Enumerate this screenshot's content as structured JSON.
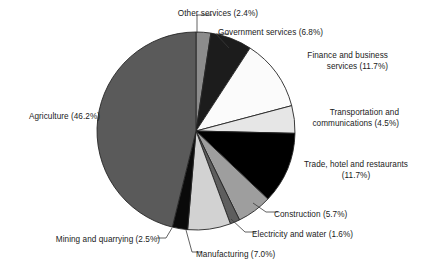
{
  "chart_data": {
    "type": "pie",
    "title": "",
    "subtitle": "",
    "xlabel": "",
    "ylabel": "",
    "legend_position": "none",
    "grid": false,
    "units": "percent",
    "total": 100.0,
    "categories": [
      "Other services",
      "Government services",
      "Finance and business services",
      "Transportation and communications",
      "Trade, hotel and restaurants",
      "Construction",
      "Electricity and water",
      "Manufacturing",
      "Mining and quarrying",
      "Agriculture"
    ],
    "values": [
      2.4,
      6.8,
      11.7,
      4.5,
      11.7,
      5.7,
      1.6,
      7.0,
      2.5,
      46.2
    ],
    "slices": [
      {
        "name": "Other services",
        "value": 2.4,
        "label": "Other services (2.4%)",
        "color": "#8c8c8c"
      },
      {
        "name": "Government services",
        "value": 6.8,
        "label": "Government services (6.8%)",
        "color": "#1c1c1c"
      },
      {
        "name": "Finance and business services",
        "value": 11.7,
        "label_line1": "Finance and business",
        "label_line2": "services (11.7%)",
        "color": "#fbfbfb"
      },
      {
        "name": "Transportation and communications",
        "value": 4.5,
        "label_line1": "Transportation and",
        "label_line2": "communications (4.5%)",
        "color": "#e6e6e6"
      },
      {
        "name": "Trade, hotel and restaurants",
        "value": 11.7,
        "label_line1": "Trade, hotel and restaurants",
        "label_line2": "(11.7%)",
        "color": "#000000"
      },
      {
        "name": "Construction",
        "value": 5.7,
        "label": "Construction (5.7%)",
        "color": "#9e9e9e"
      },
      {
        "name": "Electricity and water",
        "value": 1.6,
        "label": "Electricity and water (1.6%)",
        "color": "#5e5e5e"
      },
      {
        "name": "Manufacturing",
        "value": 7.0,
        "label": "Manufacturing (7.0%)",
        "color": "#d2d2d2"
      },
      {
        "name": "Mining and quarrying",
        "value": 2.5,
        "label": "Mining and quarrying (2.5%)",
        "color": "#0a0a0a"
      },
      {
        "name": "Agriculture",
        "value": 46.2,
        "label": "Agriculture (46.2%)",
        "color": "#5a5a5a"
      }
    ]
  },
  "geometry": {
    "center_x": 196,
    "center_y": 131,
    "radius": 99,
    "start_angle_deg": -90
  },
  "style": {
    "background": "#ffffff",
    "outline": "#262626",
    "text": "#1a1a1a",
    "leader": "#3a3a3a"
  }
}
